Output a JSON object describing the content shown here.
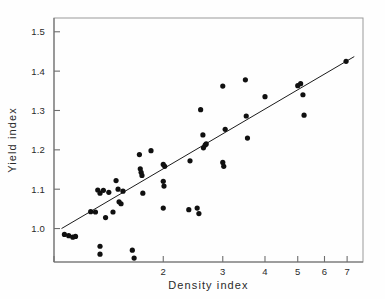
{
  "chart_data": {
    "type": "scatter",
    "title": "",
    "xlabel": "Density index",
    "ylabel": "Yield index",
    "xscale": "log",
    "yscale": "linear",
    "xlim": [
      0.95,
      7.8
    ],
    "ylim": [
      0.915,
      1.535
    ],
    "grid": false,
    "legend": null,
    "xticks": [
      2,
      3,
      4,
      5,
      6,
      7
    ],
    "xtick_labels": [
      "2",
      "3",
      "4",
      "5",
      "6",
      "7"
    ],
    "yticks": [
      1.0,
      1.1,
      1.2,
      1.3,
      1.4,
      1.5
    ],
    "ytick_labels": [
      "1.0",
      "1.1",
      "1.2",
      "1.3",
      "1.4",
      "1.5"
    ],
    "series": [
      {
        "name": "observations",
        "marker": "filled-circle",
        "color": "#101010",
        "points": [
          [
            1.02,
            0.985
          ],
          [
            1.05,
            0.982
          ],
          [
            1.08,
            0.978
          ],
          [
            1.1,
            0.98
          ],
          [
            1.22,
            1.043
          ],
          [
            1.26,
            1.042
          ],
          [
            1.3,
            0.955
          ],
          [
            1.3,
            0.935
          ],
          [
            1.28,
            1.098
          ],
          [
            1.3,
            1.09
          ],
          [
            1.33,
            1.097
          ],
          [
            1.35,
            1.028
          ],
          [
            1.38,
            1.092
          ],
          [
            1.42,
            1.042
          ],
          [
            1.45,
            1.122
          ],
          [
            1.47,
            1.1
          ],
          [
            1.48,
            1.068
          ],
          [
            1.5,
            1.063
          ],
          [
            1.52,
            1.095
          ],
          [
            1.62,
            0.945
          ],
          [
            1.64,
            0.925
          ],
          [
            1.7,
            1.188
          ],
          [
            1.71,
            1.152
          ],
          [
            1.72,
            1.143
          ],
          [
            1.73,
            1.135
          ],
          [
            1.74,
            1.09
          ],
          [
            1.84,
            1.198
          ],
          [
            2.0,
            1.163
          ],
          [
            2.02,
            1.158
          ],
          [
            2.0,
            1.12
          ],
          [
            2.01,
            1.108
          ],
          [
            2.0,
            1.052
          ],
          [
            2.38,
            1.048
          ],
          [
            2.4,
            1.172
          ],
          [
            2.52,
            1.052
          ],
          [
            2.55,
            1.038
          ],
          [
            2.58,
            1.302
          ],
          [
            2.62,
            1.238
          ],
          [
            2.63,
            1.205
          ],
          [
            2.66,
            1.212
          ],
          [
            2.68,
            1.215
          ],
          [
            3.0,
            1.362
          ],
          [
            3.0,
            1.168
          ],
          [
            3.02,
            1.158
          ],
          [
            3.05,
            1.252
          ],
          [
            3.5,
            1.378
          ],
          [
            3.52,
            1.286
          ],
          [
            3.55,
            1.23
          ],
          [
            4.0,
            1.335
          ],
          [
            5.0,
            1.363
          ],
          [
            5.1,
            1.368
          ],
          [
            5.18,
            1.34
          ],
          [
            5.22,
            1.288
          ],
          [
            6.95,
            1.425
          ]
        ]
      }
    ],
    "fit_line": {
      "name": "regression line",
      "color": "#1c1c1c",
      "start": [
        1.0,
        1.0
      ],
      "end": [
        7.35,
        1.437
      ]
    }
  }
}
